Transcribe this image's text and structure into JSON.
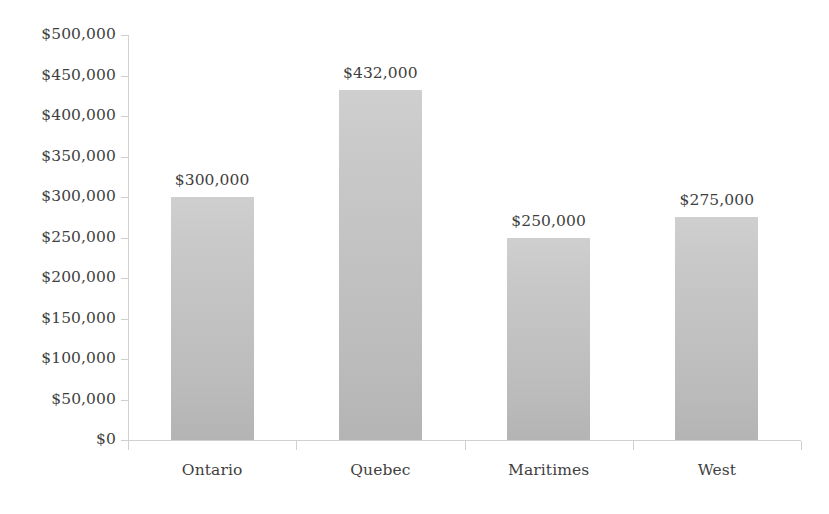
{
  "chart_data": {
    "type": "bar",
    "title": "",
    "subtitle": "",
    "xlabel": "",
    "ylabel": "",
    "categories": [
      "Ontario",
      "Quebec",
      "Maritimes",
      "West"
    ],
    "values": [
      300000,
      432000,
      250000,
      275000
    ],
    "value_labels": [
      "$300,000",
      "$432,000",
      "$250,000",
      "$275,000"
    ],
    "ylim": [
      0,
      500000
    ],
    "ytick_step": 50000,
    "ytick_labels": [
      "$500,000",
      "$450,000",
      "$400,000",
      "$350,000",
      "$300,000",
      "$250,000",
      "$200,000",
      "$150,000",
      "$100,000",
      "$50,000",
      "$0"
    ],
    "ytick_values": [
      500000,
      450000,
      400000,
      350000,
      300000,
      250000,
      200000,
      150000,
      100000,
      50000,
      0
    ],
    "grid": false,
    "legend": false,
    "legend_position": "none",
    "series": [
      {
        "name": "Sales",
        "values": [
          300000,
          432000,
          250000,
          275000
        ]
      }
    ],
    "colors": {
      "bar_top": "#cfcfcf",
      "bar_bottom": "#b4b4b4",
      "axis": "#d0d0d0",
      "text": "#3f3f3f",
      "background": "#ffffff"
    }
  }
}
